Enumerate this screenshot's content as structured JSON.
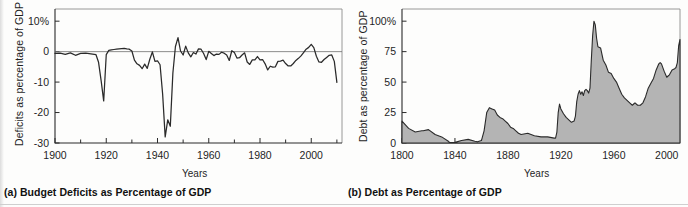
{
  "figure": {
    "bottom_rule": true
  },
  "panel_a": {
    "caption": "(a) Budget Deficits as Percentage of GDP",
    "ytitle": "Deficits as percentage of GDP",
    "xtitle": "Years"
  },
  "panel_b": {
    "caption": "(b) Debt as Percentage of GDP",
    "ytitle": "Debt as percentage of GDP",
    "xtitle": "Years"
  },
  "chart_data": [
    {
      "id": "deficits",
      "type": "line",
      "title": "(a) Budget Deficits as Percentage of GDP",
      "xlabel": "Years",
      "ylabel": "Deficits as percentage of GDP",
      "xlim": [
        1900,
        2012
      ],
      "ylim": [
        -30,
        14
      ],
      "grid": false,
      "legend": "none",
      "ytick_labels": [
        "10%",
        "0",
        "-10",
        "-20",
        "-30"
      ],
      "ytick_values": [
        10,
        0,
        -10,
        -20,
        -30
      ],
      "xtick_labels": [
        "1900",
        "1920",
        "1940",
        "1960",
        "1980",
        "2000"
      ],
      "xtick_values": [
        1900,
        1920,
        1940,
        1960,
        1980,
        2000
      ],
      "xtick_minor": [
        1910,
        1930,
        1950,
        1970,
        1990,
        2010
      ],
      "zero_reference_line": 0,
      "x": [
        1900,
        1902,
        1904,
        1906,
        1908,
        1910,
        1912,
        1914,
        1916,
        1917,
        1918,
        1919,
        1920,
        1921,
        1922,
        1923,
        1924,
        1925,
        1926,
        1927,
        1928,
        1929,
        1930,
        1931,
        1932,
        1933,
        1934,
        1935,
        1936,
        1937,
        1938,
        1939,
        1940,
        1941,
        1942,
        1943,
        1944,
        1945,
        1946,
        1947,
        1948,
        1949,
        1950,
        1951,
        1952,
        1953,
        1954,
        1955,
        1956,
        1957,
        1958,
        1959,
        1960,
        1961,
        1962,
        1963,
        1964,
        1965,
        1966,
        1967,
        1968,
        1969,
        1970,
        1971,
        1972,
        1973,
        1974,
        1975,
        1976,
        1977,
        1978,
        1979,
        1980,
        1981,
        1982,
        1983,
        1984,
        1985,
        1986,
        1987,
        1988,
        1989,
        1990,
        1991,
        1992,
        1993,
        1994,
        1995,
        1996,
        1997,
        1998,
        1999,
        2000,
        2001,
        2002,
        2003,
        2004,
        2005,
        2006,
        2007,
        2008,
        2009,
        2010
      ],
      "y": [
        -0.6,
        -0.5,
        -0.9,
        -0.4,
        -1.2,
        -0.6,
        -0.5,
        -0.7,
        -1.0,
        -3.5,
        -9.5,
        -16.2,
        -1.0,
        0.4,
        0.6,
        0.7,
        0.8,
        0.9,
        1.0,
        1.1,
        0.9,
        0.8,
        0.2,
        -2.8,
        -4.0,
        -4.5,
        -5.6,
        -4.1,
        -5.5,
        -2.5,
        -0.1,
        -3.2,
        -3.0,
        -4.3,
        -13.9,
        -28.0,
        -22.4,
        -24.5,
        -7.0,
        1.7,
        4.6,
        0.2,
        -1.1,
        1.8,
        -0.4,
        -1.7,
        -0.3,
        -0.8,
        0.9,
        0.8,
        -0.6,
        -2.6,
        0.1,
        -0.6,
        -1.3,
        -0.8,
        -0.9,
        -0.2,
        -0.5,
        -1.1,
        -2.9,
        0.3,
        -0.3,
        -2.1,
        -2.0,
        -1.1,
        -0.4,
        -3.4,
        -4.2,
        -2.7,
        -2.7,
        -1.6,
        -2.7,
        -2.6,
        -4.0,
        -6.0,
        -4.8,
        -5.1,
        -5.0,
        -3.2,
        -3.1,
        -2.8,
        -3.9,
        -4.7,
        -4.7,
        -3.9,
        -2.9,
        -2.2,
        -1.4,
        -0.3,
        0.8,
        1.4,
        2.4,
        1.3,
        -1.5,
        -3.4,
        -3.5,
        -2.6,
        -1.9,
        -1.2,
        -1.1,
        -3.2,
        -10.1,
        -9.0
      ],
      "notes": [
        "WWI trough about -16% of GDP around 1919",
        "WWII trough about -28 to -30% of GDP around 1943",
        "Surpluses (positive values) in late 1990s, peak about +2.4% in 2000",
        "Sharp deficit to about -10% in 2009"
      ]
    },
    {
      "id": "debt",
      "type": "area",
      "title": "(b) Debt as Percentage of GDP",
      "xlabel": "Years",
      "ylabel": "Debt as percentage of GDP",
      "xlim": [
        1800,
        2010
      ],
      "ylim": [
        0,
        110
      ],
      "grid": false,
      "legend": "none",
      "fill_color": "#b4b4b4",
      "ytick_labels": [
        "100%",
        "75",
        "50",
        "25",
        "0"
      ],
      "ytick_values": [
        100,
        75,
        50,
        25,
        0
      ],
      "xtick_labels": [
        "1800",
        "1840",
        "1880",
        "1920",
        "1960",
        "2000"
      ],
      "xtick_values": [
        1800,
        1840,
        1880,
        1920,
        1960,
        2000
      ],
      "xtick_minor": [
        1820,
        1860,
        1900,
        1940,
        1980
      ],
      "x": [
        1800,
        1805,
        1810,
        1815,
        1816,
        1820,
        1825,
        1830,
        1835,
        1836,
        1840,
        1845,
        1850,
        1855,
        1857,
        1860,
        1862,
        1864,
        1866,
        1868,
        1870,
        1872,
        1874,
        1876,
        1878,
        1880,
        1882,
        1884,
        1886,
        1888,
        1890,
        1895,
        1900,
        1905,
        1910,
        1915,
        1916,
        1917,
        1918,
        1919,
        1920,
        1922,
        1924,
        1926,
        1928,
        1930,
        1931,
        1932,
        1933,
        1934,
        1935,
        1936,
        1937,
        1938,
        1939,
        1940,
        1941,
        1942,
        1943,
        1944,
        1945,
        1946,
        1947,
        1948,
        1950,
        1952,
        1954,
        1956,
        1958,
        1960,
        1962,
        1964,
        1966,
        1968,
        1970,
        1972,
        1974,
        1975,
        1976,
        1978,
        1980,
        1982,
        1984,
        1986,
        1988,
        1990,
        1992,
        1994,
        1995,
        1996,
        1998,
        2000,
        2001,
        2002,
        2004,
        2006,
        2007,
        2008,
        2009,
        2010
      ],
      "y": [
        18,
        12,
        9,
        10,
        10,
        11,
        7,
        5,
        1.5,
        0.3,
        0.5,
        2,
        3,
        1.5,
        1,
        2,
        10,
        25,
        29,
        28,
        27,
        23,
        21,
        20,
        18,
        16,
        13,
        12,
        10,
        8,
        7,
        8,
        6,
        5,
        5,
        4,
        4,
        9,
        25,
        32,
        28,
        24,
        21,
        19,
        17,
        18,
        22,
        34,
        40,
        43,
        40,
        42,
        39,
        43,
        44,
        43,
        41,
        45,
        68,
        88,
        100,
        97,
        86,
        79,
        78,
        68,
        64,
        58,
        57,
        53,
        50,
        45,
        40,
        37,
        35,
        33,
        31,
        32,
        33,
        31,
        31,
        33,
        38,
        45,
        49,
        53,
        60,
        65,
        66,
        65,
        59,
        54,
        55,
        56,
        60,
        61,
        62,
        66,
        80,
        85
      ],
      "notes": [
        "Low debt trough near 0% around 1835-1840",
        "Civil War rise to about 29% by 1866",
        "WWI rise to about 32% around 1919",
        "WWII peak about 100%+ around 1946",
        "Post-war decline to about 20-22% around 1974",
        "Rise through 1980s-1990s to about 65-68%, dip to ~55% around 2000, rising to about 85% in 2010"
      ]
    }
  ]
}
